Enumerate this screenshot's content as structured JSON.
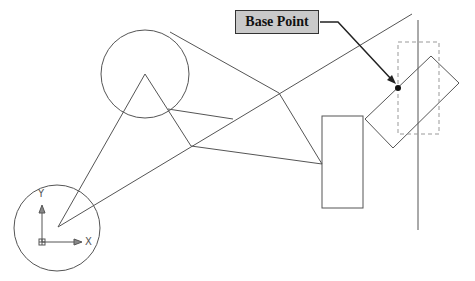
{
  "callout": {
    "label": "Base Point"
  },
  "ucs": {
    "x_label": "X",
    "y_label": "Y"
  },
  "colors": {
    "line": "#555555",
    "label_bg": "#c9c9c9",
    "dashed": "#999999",
    "arrow": "#222222"
  }
}
